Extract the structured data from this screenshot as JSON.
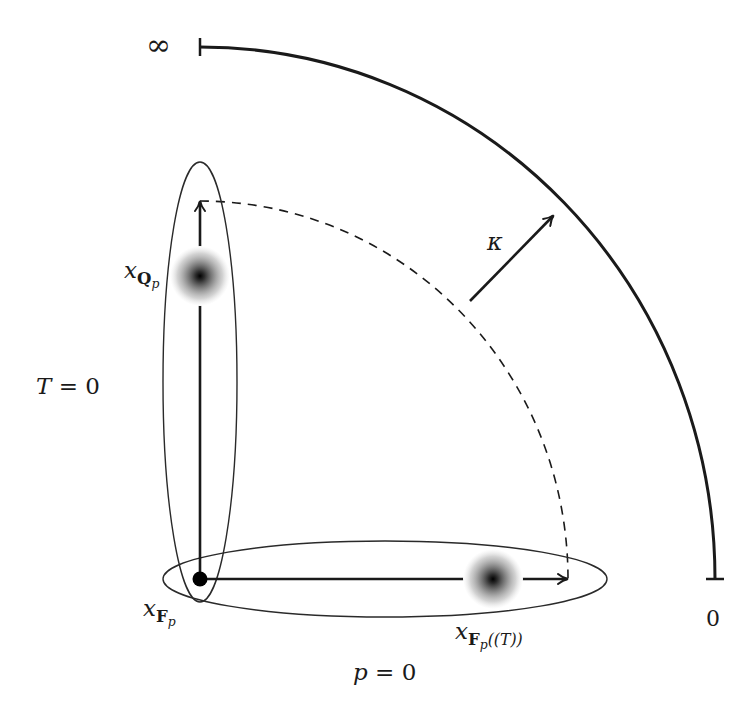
{
  "diagram": {
    "colors": {
      "background": "#ffffff",
      "stroke": "#1a1a1a",
      "ellipse_stroke": "#2a2a2a",
      "blob_core": "#000000"
    },
    "labels": {
      "infinity": "∞",
      "zero": "0",
      "t_eq_zero": {
        "var": "T",
        "rest": " = 0"
      },
      "p_eq_zero": {
        "var": "p",
        "rest": " = 0"
      },
      "kappa": "κ",
      "x_Qp": {
        "base": "x",
        "sub_bold": "Q",
        "sub_sub": "p"
      },
      "x_Fp": {
        "base": "x",
        "sub_bold": "F",
        "sub_sub": "p"
      },
      "x_FpT": {
        "base": "x",
        "sub_bold": "F",
        "sub_sub": "p",
        "tail": "((T))"
      }
    },
    "elements": {
      "outer_arc": {
        "center": [
          200,
          579
        ],
        "rx": 515,
        "ry": 532,
        "from": "top",
        "to": "right",
        "end_ticks": true
      },
      "dashed_arc": {
        "center": [
          200,
          579
        ],
        "rx": 368,
        "ry": 378,
        "style": "dashed"
      },
      "vertical_ellipse": {
        "cx": 200,
        "cy": 382,
        "rx": 37,
        "ry": 220
      },
      "horizontal_ellipse": {
        "cx": 385,
        "cy": 579,
        "rx": 222,
        "ry": 38
      },
      "vertical_arrow": {
        "from": [
          200,
          579
        ],
        "to": [
          200,
          201
        ]
      },
      "horizontal_arrow": {
        "from": [
          200,
          579
        ],
        "to": [
          568,
          579
        ]
      },
      "kappa_arrow": {
        "from": [
          470,
          301
        ],
        "to": [
          554,
          215
        ]
      },
      "origin_dot": {
        "cx": 200,
        "cy": 579,
        "r": 7
      },
      "blob_Qp": {
        "cx": 200,
        "cy": 276,
        "r": 30
      },
      "blob_FpT": {
        "cx": 493,
        "cy": 579,
        "r": 30
      }
    }
  }
}
